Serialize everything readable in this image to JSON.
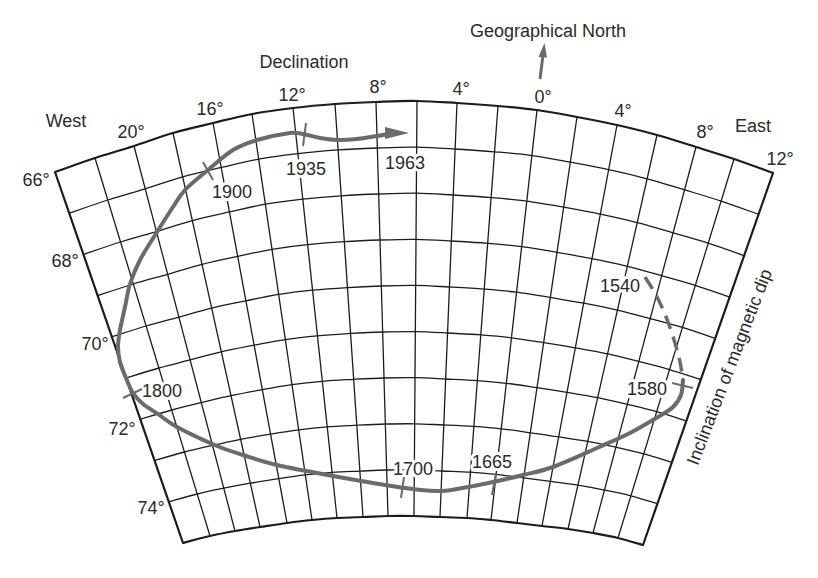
{
  "labels": {
    "geographical_north": "Geographical North",
    "declination": "Declination",
    "west": "West",
    "east": "East",
    "inclination": "Inclination of magnetic dip"
  },
  "declination_ticks": [
    "20°",
    "16°",
    "12°",
    "8°",
    "4°",
    "0°",
    "4°",
    "8°",
    "12°"
  ],
  "inclination_ticks": [
    "66°",
    "68°",
    "70°",
    "72°",
    "74°"
  ],
  "year_markers": [
    {
      "year": "1540",
      "line": "dashed",
      "declination_deg": 7,
      "declination_dir": "E",
      "inclination_deg": 69
    },
    {
      "year": "1580",
      "line": "solid",
      "declination_deg": 11,
      "declination_dir": "E",
      "inclination_deg": 71
    },
    {
      "year": "1665",
      "line": "solid",
      "declination_deg": 0,
      "declination_dir": "",
      "inclination_deg": 74
    },
    {
      "year": "1700",
      "line": "solid",
      "declination_deg": 7,
      "declination_dir": "W",
      "inclination_deg": 74.5
    },
    {
      "year": "1800",
      "line": "solid",
      "declination_deg": 24,
      "declination_dir": "W",
      "inclination_deg": 71.5
    },
    {
      "year": "1900",
      "line": "solid",
      "declination_deg": 17,
      "declination_dir": "W",
      "inclination_deg": 67
    },
    {
      "year": "1935",
      "line": "solid",
      "declination_deg": 12,
      "declination_dir": "W",
      "inclination_deg": 66.5
    },
    {
      "year": "1963",
      "line": "solid-arrow",
      "declination_deg": 6.5,
      "declination_dir": "W",
      "inclination_deg": 66.7
    }
  ],
  "diagram_data": {
    "type": "secular-variation-grid",
    "declination_range": {
      "from": "24°W",
      "to": "12°E",
      "step_deg": 2
    },
    "inclination_range": {
      "from": 66,
      "to": 75,
      "step_deg": 1
    },
    "grid_columns": 18,
    "grid_rows": 9
  },
  "colors": {
    "grid": "#1c1c1c",
    "path": "#6b6b6b",
    "text": "#2a2a2a",
    "background": "#ffffff"
  }
}
